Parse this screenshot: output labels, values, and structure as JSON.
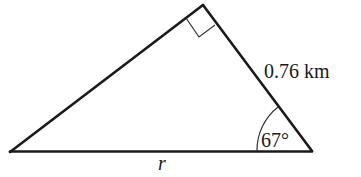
{
  "diagram": {
    "type": "right-triangle",
    "vertices": {
      "left": [
        10,
        152
      ],
      "apex": [
        203,
        5
      ],
      "right": [
        312,
        151
      ]
    },
    "right_angle_at": "apex",
    "right_angle_marker": [
      [
        186,
        19
      ],
      [
        199,
        37
      ],
      [
        215,
        25
      ]
    ],
    "angle_arc": {
      "vertex": "right",
      "radius": 55,
      "start_deg": 180,
      "end_deg": 233
    },
    "colors": {
      "stroke": "#1a1a1a",
      "background": "#ffffff"
    },
    "labels": {
      "hypotenuse_side": "0.76 km",
      "base": "r",
      "angle": "67°"
    }
  }
}
